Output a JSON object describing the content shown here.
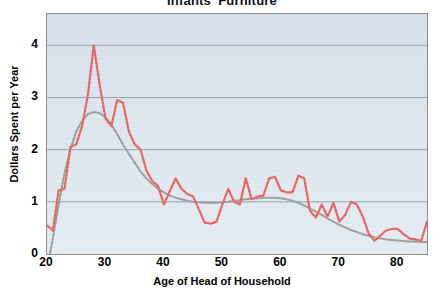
{
  "chart_data": {
    "type": "line",
    "title": "Infants' Furniture",
    "xlabel": "Age of Head of Household",
    "ylabel": "Dollars Spent per Year",
    "xlim": [
      20,
      85
    ],
    "ylim": [
      0,
      4.6
    ],
    "grid": true,
    "legend": "none",
    "xticks": [
      20,
      30,
      40,
      50,
      60,
      70,
      80
    ],
    "yticks": [
      0,
      1,
      2,
      3,
      4
    ],
    "ytick_labels": [
      "0",
      "1",
      "2",
      "3",
      "4"
    ],
    "xtick_labels": [
      "20",
      "30",
      "40",
      "50",
      "60",
      "70",
      "80"
    ],
    "series": [
      {
        "name": "Observed spending",
        "color": "#e8615c",
        "style": "solid",
        "width": 2.2,
        "x": [
          20,
          21,
          22,
          23,
          24,
          25,
          26,
          27,
          28,
          29,
          30,
          31,
          32,
          33,
          34,
          35,
          36,
          37,
          38,
          39,
          40,
          41,
          42,
          43,
          44,
          45,
          46,
          47,
          48,
          49,
          50,
          51,
          52,
          53,
          54,
          55,
          56,
          57,
          58,
          59,
          60,
          61,
          62,
          63,
          64,
          65,
          66,
          67,
          68,
          69,
          70,
          71,
          72,
          73,
          74,
          75,
          76,
          77,
          78,
          79,
          80,
          81,
          82,
          83,
          84,
          85
        ],
        "y": [
          0.55,
          0.45,
          1.22,
          1.25,
          2.05,
          2.1,
          2.45,
          3.05,
          4.0,
          3.25,
          2.6,
          2.45,
          2.95,
          2.9,
          2.35,
          2.1,
          2.0,
          1.6,
          1.4,
          1.3,
          0.95,
          1.2,
          1.45,
          1.25,
          1.15,
          1.1,
          0.85,
          0.6,
          0.58,
          0.62,
          0.95,
          1.25,
          1.0,
          0.95,
          1.45,
          1.05,
          1.1,
          1.12,
          1.45,
          1.48,
          1.22,
          1.18,
          1.18,
          1.5,
          1.45,
          0.82,
          0.7,
          0.95,
          0.72,
          0.98,
          0.62,
          0.75,
          1.0,
          0.95,
          0.72,
          0.4,
          0.25,
          0.35,
          0.45,
          0.48,
          0.48,
          0.38,
          0.3,
          0.28,
          0.25,
          0.62
        ]
      },
      {
        "name": "Smoothed trend",
        "color": "#9b9b9b",
        "style": "solid",
        "width": 2.0,
        "x": [
          20,
          21,
          22,
          23,
          24,
          25,
          26,
          27,
          28,
          29,
          30,
          31,
          32,
          33,
          34,
          35,
          36,
          37,
          38,
          39,
          40,
          41,
          42,
          43,
          44,
          45,
          46,
          47,
          48,
          49,
          50,
          51,
          52,
          53,
          54,
          55,
          56,
          57,
          58,
          59,
          60,
          61,
          62,
          63,
          64,
          65,
          66,
          67,
          68,
          69,
          70,
          71,
          72,
          73,
          74,
          75,
          76,
          77,
          78,
          79,
          80,
          81,
          82,
          83,
          84,
          85
        ],
        "y": [
          -0.3,
          0.3,
          0.95,
          1.55,
          2.0,
          2.35,
          2.55,
          2.68,
          2.72,
          2.7,
          2.62,
          2.48,
          2.3,
          2.1,
          1.92,
          1.75,
          1.58,
          1.45,
          1.34,
          1.25,
          1.18,
          1.12,
          1.08,
          1.05,
          1.02,
          1.0,
          0.99,
          0.98,
          0.98,
          0.98,
          0.99,
          1.0,
          1.02,
          1.03,
          1.05,
          1.06,
          1.07,
          1.08,
          1.08,
          1.08,
          1.07,
          1.05,
          1.02,
          0.98,
          0.93,
          0.87,
          0.81,
          0.75,
          0.68,
          0.62,
          0.56,
          0.51,
          0.46,
          0.42,
          0.38,
          0.35,
          0.32,
          0.3,
          0.28,
          0.27,
          0.26,
          0.25,
          0.24,
          0.24,
          0.23,
          0.23
        ]
      }
    ]
  },
  "style": {
    "plot_background": "#dbe5ed",
    "grid_color": "#8d9aa6",
    "frame_color": "#8d8d8d",
    "observed_color": "#e8615c",
    "trend_color": "#9b9b9b",
    "text_color": "#000000",
    "page_background": "#ffffff"
  }
}
